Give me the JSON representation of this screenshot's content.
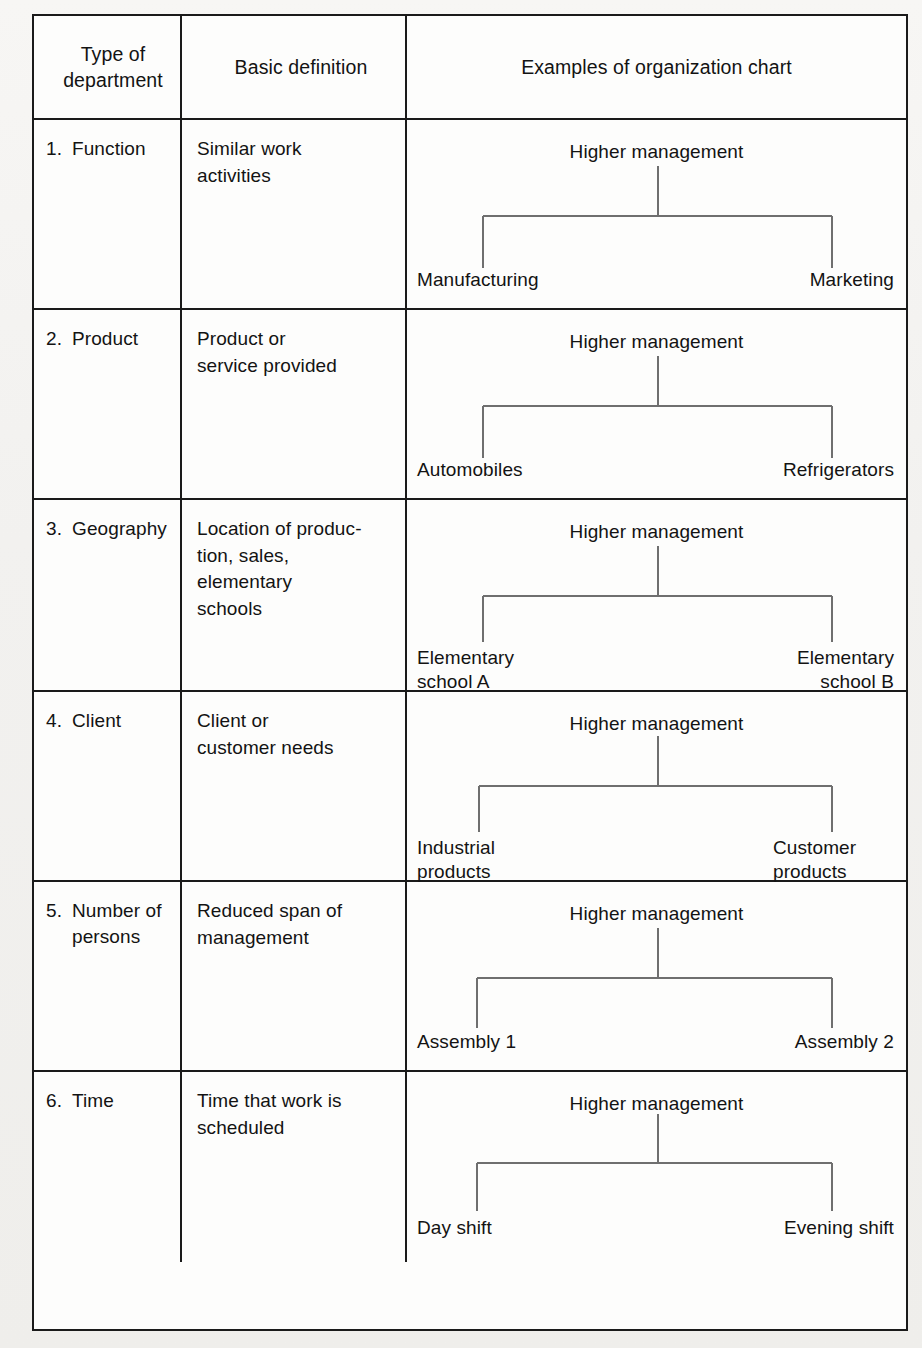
{
  "figure": {
    "type": "table",
    "columns": [
      {
        "header": "Type of\ndepartment"
      },
      {
        "header": "Basic\ndefinition"
      },
      {
        "header": "Examples of\norganization chart"
      }
    ],
    "rows": [
      {
        "num": "1.",
        "type": "Function",
        "definition": "Similar work\nactivities",
        "chart": {
          "root": "Higher management",
          "children": [
            "Manufacturing",
            "Marketing"
          ]
        }
      },
      {
        "num": "2.",
        "type": "Product",
        "definition": "Product or\nservice provided",
        "chart": {
          "root": "Higher management",
          "children": [
            "Automobiles",
            "Refrigerators"
          ]
        }
      },
      {
        "num": "3.",
        "type": "Geography",
        "definition": "Location of produc-\ntion, sales,\nelementary\nschools",
        "chart": {
          "root": "Higher management",
          "children": [
            "Elementary\nschool A",
            "Elementary\nschool B"
          ]
        }
      },
      {
        "num": "4.",
        "type": "Client",
        "definition": "Client or\ncustomer needs",
        "chart": {
          "root": "Higher management",
          "children": [
            "Industrial\nproducts",
            "Customer\nproducts"
          ]
        }
      },
      {
        "num": "5.",
        "type": "Number of\npersons",
        "definition": "Reduced span of\nmanagement",
        "chart": {
          "root": "Higher management",
          "children": [
            "Assembly 1",
            "Assembly 2"
          ]
        }
      },
      {
        "num": "6.",
        "type": "Time",
        "definition": "Time that work is\nscheduled",
        "chart": {
          "root": "Higher management",
          "children": [
            "Day shift",
            "Evening shift"
          ]
        }
      }
    ]
  },
  "colors": {
    "border": "#1a1a1a",
    "connector": "#6f6f6f",
    "text": "#131313",
    "cell_bg": "#fdfdfc",
    "page_bg": "#f2f1ef"
  }
}
